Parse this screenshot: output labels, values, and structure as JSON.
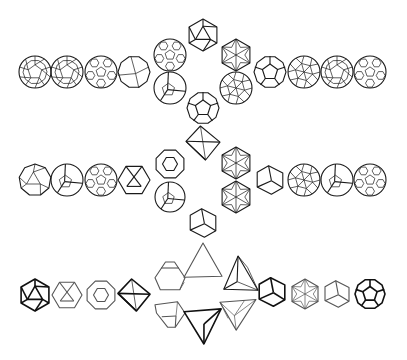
{
  "figure": {
    "stroke_color": "#1a1a1a",
    "background": "#ffffff",
    "rows": [
      {
        "id": "row-1",
        "center_y": 72,
        "left": [
          {
            "x": 35,
            "y": 72,
            "type": "sphere-faceted",
            "r": 16
          },
          {
            "x": 67,
            "y": 72,
            "type": "sphere-faceted",
            "r": 16
          },
          {
            "x": 101,
            "y": 72,
            "type": "sphere-hex",
            "r": 16
          },
          {
            "x": 134,
            "y": 72,
            "type": "sphere-coarse",
            "r": 16
          }
        ],
        "center": [
          {
            "x": 203,
            "y": 35,
            "type": "icosahedron",
            "r": 16
          },
          {
            "x": 170,
            "y": 55,
            "type": "sphere-hex",
            "r": 16
          },
          {
            "x": 236,
            "y": 55,
            "type": "hexagon-star",
            "r": 16
          },
          {
            "x": 170,
            "y": 88,
            "type": "dodeca-round",
            "r": 16
          },
          {
            "x": 236,
            "y": 88,
            "type": "sphere-tri",
            "r": 16
          },
          {
            "x": 203,
            "y": 108,
            "type": "dodecahedron",
            "r": 16
          }
        ],
        "right": [
          {
            "x": 270,
            "y": 72,
            "type": "dodecahedron",
            "r": 16
          },
          {
            "x": 304,
            "y": 72,
            "type": "sphere-tri",
            "r": 16
          },
          {
            "x": 337,
            "y": 72,
            "type": "sphere-faceted",
            "r": 16
          },
          {
            "x": 370,
            "y": 72,
            "type": "sphere-hex",
            "r": 16
          }
        ]
      },
      {
        "id": "row-2",
        "center_y": 180,
        "left": [
          {
            "x": 35,
            "y": 180,
            "type": "icosa-round",
            "r": 16
          },
          {
            "x": 67,
            "y": 180,
            "type": "dodeca-round",
            "r": 16
          },
          {
            "x": 101,
            "y": 180,
            "type": "sphere-hex",
            "r": 16
          },
          {
            "x": 134,
            "y": 180,
            "type": "cuboct",
            "r": 16
          }
        ],
        "center": [
          {
            "x": 203,
            "y": 143,
            "type": "octahedron",
            "r": 17
          },
          {
            "x": 170,
            "y": 164,
            "type": "truncated-oct",
            "r": 15
          },
          {
            "x": 236,
            "y": 163,
            "type": "hexagon-star",
            "r": 16
          },
          {
            "x": 170,
            "y": 197,
            "type": "dodeca-round",
            "r": 15
          },
          {
            "x": 236,
            "y": 197,
            "type": "hexagon-star",
            "r": 16
          },
          {
            "x": 203,
            "y": 223,
            "type": "cube",
            "r": 15
          }
        ],
        "right": [
          {
            "x": 270,
            "y": 180,
            "type": "cube",
            "r": 15
          },
          {
            "x": 304,
            "y": 180,
            "type": "sphere-tri",
            "r": 16
          },
          {
            "x": 337,
            "y": 180,
            "type": "dodeca-round",
            "r": 16
          },
          {
            "x": 370,
            "y": 180,
            "type": "sphere-hex",
            "r": 16
          }
        ]
      },
      {
        "id": "row-3",
        "center_y": 295,
        "left": [
          {
            "x": 35,
            "y": 295,
            "type": "icosahedron",
            "r": 16,
            "weight": "heavy"
          },
          {
            "x": 67,
            "y": 295,
            "type": "cuboct",
            "r": 15,
            "weight": "light"
          },
          {
            "x": 101,
            "y": 295,
            "type": "truncated-oct",
            "r": 15,
            "weight": "light"
          },
          {
            "x": 134,
            "y": 295,
            "type": "octahedron",
            "r": 16,
            "weight": "heavy"
          }
        ],
        "center": [
          {
            "x": 203,
            "y": 262,
            "type": "triangle-up",
            "r": 19,
            "weight": "light"
          },
          {
            "x": 170,
            "y": 277,
            "type": "trunc-tetra",
            "r": 15,
            "weight": "light"
          },
          {
            "x": 239,
            "y": 275,
            "type": "tetra-side",
            "r": 19
          },
          {
            "x": 170,
            "y": 313,
            "type": "trunc-tetra-down",
            "r": 15,
            "weight": "light"
          },
          {
            "x": 238,
            "y": 313,
            "type": "tetra-down-star",
            "r": 18,
            "weight": "light"
          },
          {
            "x": 203,
            "y": 325,
            "type": "triangle-down",
            "r": 19,
            "weight": "heavy"
          }
        ],
        "right": [
          {
            "x": 272,
            "y": 292,
            "type": "cube",
            "r": 15,
            "weight": "heavy"
          },
          {
            "x": 305,
            "y": 294,
            "type": "hexagon-star",
            "r": 15,
            "weight": "light"
          },
          {
            "x": 337,
            "y": 294,
            "type": "cube",
            "r": 14,
            "weight": "light"
          },
          {
            "x": 370,
            "y": 294,
            "type": "dodecahedron",
            "r": 15,
            "weight": "heavy"
          }
        ]
      }
    ]
  }
}
